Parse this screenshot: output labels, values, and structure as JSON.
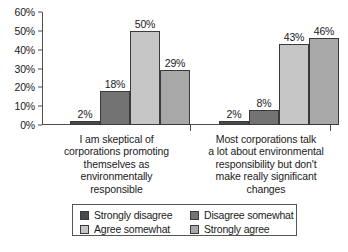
{
  "chart_data": {
    "type": "bar",
    "title": "",
    "subtitle": "",
    "xlabel": "",
    "ylabel": "",
    "ylim": [
      0,
      60
    ],
    "y_tick_labels": [
      "0%",
      "10%",
      "20%",
      "30%",
      "40%",
      "50%",
      "60%"
    ],
    "y_tick_values": [
      0,
      10,
      20,
      30,
      40,
      50,
      60
    ],
    "grid": false,
    "legend_position": "bottom",
    "value_label_suffix": "%",
    "categories": [
      "I am skeptical of corporations promoting themselves as environmentally responsible",
      "Most corporations talk a lot about environmental responsibility but don't make really significant changes"
    ],
    "category_lines": [
      [
        "I am skeptical of",
        "corporations promoting",
        "themselves as",
        "environmentally",
        "responsible"
      ],
      [
        "Most corporations talk",
        "a lot about environmental",
        "responsibility but don't",
        "make really significant",
        "changes"
      ]
    ],
    "series": [
      {
        "name": "Strongly disagree",
        "color": "#4a4a4a",
        "values": [
          2,
          2
        ],
        "labels": [
          "2%",
          "2%"
        ]
      },
      {
        "name": "Disagree somewhat",
        "color": "#737373",
        "values": [
          18,
          8
        ],
        "labels": [
          "18%",
          "8%"
        ]
      },
      {
        "name": "Agree somewhat",
        "color": "#c6c6c6",
        "values": [
          50,
          43
        ],
        "labels": [
          "50%",
          "43%"
        ]
      },
      {
        "name": "Strongly agree",
        "color": "#a8a8a8",
        "values": [
          29,
          46
        ],
        "labels": [
          "29%",
          "46%"
        ]
      }
    ]
  }
}
